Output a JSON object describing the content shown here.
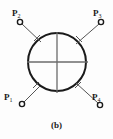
{
  "figure": {
    "caption": "(b)",
    "background_color": "#fdfdfd",
    "stroke_color": "#1a1a1a",
    "inner_line_color": "#6b6b6b",
    "main_circle": {
      "cx": 57,
      "cy": 62,
      "r": 29,
      "stroke_width": 2.0
    },
    "cross_lines": [
      {
        "name": "vertical-diameter",
        "x1": 57,
        "y1": 32,
        "x2": 57,
        "y2": 93
      },
      {
        "name": "horizontal-diameter",
        "x1": 27,
        "y1": 62,
        "x2": 88,
        "y2": 62
      }
    ],
    "nodes": [
      {
        "id": "p1",
        "label": "P",
        "subscript": "1",
        "position": "bottom-left",
        "marker": {
          "cx": 22,
          "cy": 104,
          "r": 2.6
        },
        "lead_line": {
          "x1": 24,
          "y1": 102,
          "x2": 40,
          "y2": 86
        },
        "tick": {
          "x1": 33,
          "y1": 88,
          "x2": 39,
          "y2": 82
        }
      },
      {
        "id": "p2",
        "label": "P",
        "subscript": "2",
        "position": "top-left",
        "marker": {
          "cx": 20,
          "cy": 22,
          "r": 2.6
        },
        "lead_line": {
          "x1": 22,
          "y1": 24,
          "x2": 41,
          "y2": 42
        },
        "tick": {
          "x1": 34,
          "y1": 41,
          "x2": 40,
          "y2": 35
        }
      },
      {
        "id": "p3",
        "label": "P",
        "subscript": "3",
        "position": "top-right",
        "marker": {
          "cx": 101,
          "cy": 22,
          "r": 2.6
        },
        "lead_line": {
          "x1": 99,
          "y1": 24,
          "x2": 76,
          "y2": 44
        },
        "tick": {
          "x1": 76,
          "y1": 36,
          "x2": 82,
          "y2": 42
        }
      },
      {
        "id": "p4",
        "label": "P",
        "subscript": "4",
        "position": "bottom-right",
        "marker": {
          "cx": 100,
          "cy": 105,
          "r": 2.6
        },
        "lead_line": {
          "x1": 98,
          "y1": 103,
          "x2": 76,
          "y2": 83
        },
        "tick": {
          "x1": 75,
          "y1": 88,
          "x2": 81,
          "y2": 82
        }
      }
    ]
  }
}
